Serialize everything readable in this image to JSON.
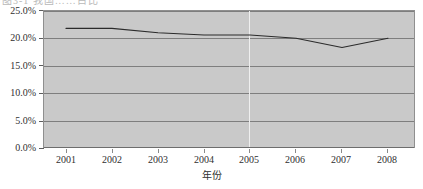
{
  "caption_remnant": "图3-1  我国……占比",
  "chart_data": {
    "type": "line",
    "title": "",
    "subtitle": "",
    "xlabel": "年份",
    "ylabel": "",
    "categories": [
      "2001",
      "2002",
      "2003",
      "2004",
      "2005",
      "2006",
      "2007",
      "2008"
    ],
    "x": [
      2001,
      2002,
      2003,
      2004,
      2005,
      2006,
      2007,
      2008
    ],
    "values": [
      21.8,
      21.8,
      21.0,
      20.6,
      20.6,
      20.0,
      18.3,
      20.0
    ],
    "series": [
      {
        "name": "",
        "values": [
          21.8,
          21.8,
          21.0,
          20.6,
          20.6,
          20.0,
          18.3,
          20.0
        ]
      }
    ],
    "ylim": [
      0.0,
      25.0
    ],
    "ytick_values": [
      0.0,
      5.0,
      10.0,
      15.0,
      20.0,
      25.0
    ],
    "ytick_labels": [
      "0.0%",
      "5.0%",
      "10.0%",
      "15.0%",
      "20.0%",
      "25.0%"
    ],
    "xtick_labels": [
      "2001",
      "2002",
      "2003",
      "2004",
      "2005",
      "2006",
      "2007",
      "2008"
    ],
    "grid": true,
    "grid_axis": "y",
    "legend": false,
    "legend_position": "none",
    "plot_background": "#c9c9c9",
    "line_color": "#2b2b2b",
    "gridline_color": "#7e7e7e",
    "marker_gridline_color": "#efefef",
    "marker_gridline_x": "2005",
    "annotations": []
  }
}
